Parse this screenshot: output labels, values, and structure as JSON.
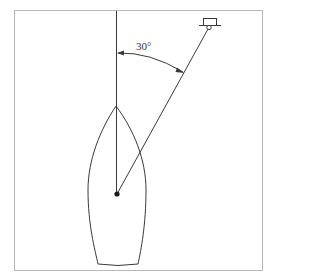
{
  "diagram": {
    "type": "boat-bearing-diagram",
    "angle_label": "30°",
    "colors": {
      "line": "#3a3a3a",
      "frame": "#b8b8b8",
      "background": "#ffffff"
    },
    "elements": {
      "frame": "bordered-box",
      "heading_line": "vertical line from bow through pivot point",
      "bearing_line": "line from pivot point to target icon",
      "hull": "pointed boat hull outline (top view)",
      "pivot_point": "filled dot",
      "target_icon": "small rectangle on ground line with circle (marker/trailer)",
      "angle_arc": "double-headed arc between heading and bearing lines"
    }
  }
}
